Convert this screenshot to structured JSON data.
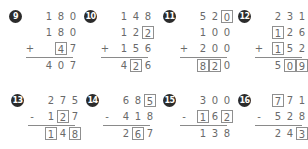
{
  "problems": [
    {
      "number": "9",
      "operator": "+",
      "rows": [
        [
          "1",
          "8",
          "0"
        ],
        [
          "1",
          "8",
          "0"
        ],
        [
          "",
          "4",
          "7"
        ]
      ],
      "answer": [
        "4",
        "0",
        "7"
      ],
      "boxed": [
        [
          2,
          1
        ]
      ],
      "answer_boxed": []
    },
    {
      "number": "10",
      "operator": "+",
      "rows": [
        [
          "1",
          "4",
          "8"
        ],
        [
          "1",
          "2",
          "2"
        ],
        [
          "1",
          "5",
          "6"
        ]
      ],
      "answer": [
        "4",
        "2",
        "6"
      ],
      "boxed": [
        [
          1,
          2
        ]
      ],
      "answer_boxed": [
        1
      ]
    },
    {
      "number": "11",
      "operator": "+",
      "rows": [
        [
          "5",
          "2",
          "0"
        ],
        [
          "1",
          "0",
          "0"
        ],
        [
          "2",
          "0",
          "0"
        ]
      ],
      "answer": [
        "8",
        "2",
        "0"
      ],
      "boxed": [
        [
          0,
          2
        ]
      ],
      "answer_boxed": [
        0,
        1
      ]
    },
    {
      "number": "12",
      "operator": "+",
      "rows": [
        [
          "2",
          "3",
          "1"
        ],
        [
          "1",
          "2",
          "6"
        ],
        [
          "1",
          "5",
          "2"
        ]
      ],
      "answer": [
        "5",
        "0",
        "9"
      ],
      "boxed": [
        [
          1,
          0
        ],
        [
          2,
          0
        ]
      ],
      "answer_boxed": [
        1,
        2
      ]
    },
    {
      "number": "13",
      "operator": "-",
      "rows": [
        [
          "2",
          "7",
          "5"
        ],
        [
          "1",
          "2",
          "7"
        ]
      ],
      "answer": [
        "1",
        "4",
        "8"
      ],
      "boxed": [
        [
          1,
          1
        ]
      ],
      "answer_boxed": [
        0,
        2
      ]
    },
    {
      "number": "14",
      "operator": "-",
      "rows": [
        [
          "6",
          "8",
          "5"
        ],
        [
          "4",
          "1",
          "8"
        ]
      ],
      "answer": [
        "2",
        "6",
        "7"
      ],
      "boxed": [
        [
          0,
          2
        ]
      ],
      "answer_boxed": [
        1
      ]
    },
    {
      "number": "15",
      "operator": "-",
      "rows": [
        [
          "3",
          "0",
          "0"
        ],
        [
          "1",
          "6",
          "2"
        ]
      ],
      "answer": [
        "1",
        "3",
        "8"
      ],
      "boxed": [
        [
          1,
          0
        ],
        [
          1,
          2
        ]
      ],
      "answer_boxed": []
    },
    {
      "number": "16",
      "operator": "-",
      "rows": [
        [
          "7",
          "7",
          "1"
        ],
        [
          "5",
          "2",
          "8"
        ]
      ],
      "answer": [
        "2",
        "4",
        "3"
      ],
      "boxed": [
        [
          0,
          0
        ]
      ],
      "answer_boxed": [
        2
      ]
    }
  ]
}
